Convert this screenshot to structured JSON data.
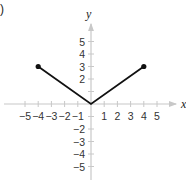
{
  "panel_label": ")",
  "chart_data": {
    "type": "line",
    "title": "",
    "xlabel": "x",
    "ylabel": "y",
    "xlim": [
      -6,
      6
    ],
    "ylim": [
      -6,
      6
    ],
    "grid": false,
    "x_ticks": [
      -5,
      -4,
      -3,
      -2,
      -1,
      1,
      2,
      3,
      4,
      5
    ],
    "y_ticks": [
      -5,
      -4,
      -3,
      -2,
      -1,
      1,
      2,
      3,
      4,
      5
    ],
    "x_tick_labels": [
      "−5",
      "−4",
      "−3",
      "−2",
      "−1",
      "1",
      "2",
      "3",
      "4",
      "5"
    ],
    "y_tick_labels_pos": [
      "5",
      "4",
      "3",
      "2"
    ],
    "y_tick_labels_neg": [
      "−1",
      "−2",
      "−3",
      "−4",
      "−5"
    ],
    "series": [
      {
        "name": "f(x) = 3|x|/4 on [-4, 4]",
        "x": [
          -4,
          0,
          4
        ],
        "y": [
          3,
          0,
          3
        ],
        "color": "#111111",
        "endpoints": "closed"
      }
    ]
  },
  "colors": {
    "axis": "#bbbbbb",
    "line": "#111111"
  }
}
